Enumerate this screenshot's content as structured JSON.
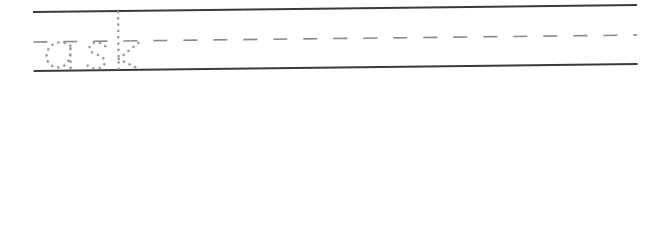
{
  "worksheet": {
    "type": "handwriting-tracing-practice",
    "rows": [
      {
        "word": "ask"
      },
      {
        "word": "take"
      },
      {
        "word": "think"
      }
    ],
    "colors": {
      "guide_line": "#3a3a3a",
      "midline_dashes": "#8a8a8a",
      "trace_dots": "#9a9a9a",
      "background": "#ffffff"
    }
  }
}
